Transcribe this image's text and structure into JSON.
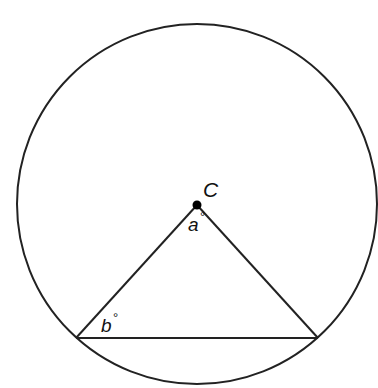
{
  "diagram": {
    "circle": {
      "cx": 197,
      "cy": 204,
      "r": 180,
      "stroke": "#222222"
    },
    "center_point": {
      "label": "C",
      "x": 197,
      "y": 205
    },
    "vertices": {
      "left": {
        "x": 76,
        "y": 338
      },
      "right": {
        "x": 318,
        "y": 338
      }
    },
    "angles": {
      "a": {
        "label": "a",
        "unit": "°",
        "at": "C"
      },
      "b": {
        "label": "b",
        "unit": "°",
        "at": "left-vertex"
      }
    },
    "degree_symbol": "°"
  }
}
